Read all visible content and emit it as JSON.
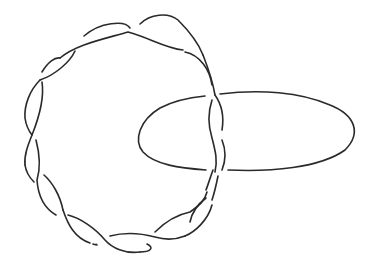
{
  "diagram": {
    "type": "knot-diagram",
    "background": "#ffffff",
    "stroke_color": "#2a2a2a",
    "stroke_width": 1.6,
    "components": [
      {
        "name": "twisted-band",
        "shape": "circular two-strand twist",
        "center": [
          120,
          135
        ],
        "radius": 100,
        "crossings": 22
      },
      {
        "name": "linking-ellipse",
        "shape": "ellipse",
        "center": [
          250,
          140
        ],
        "rx": 105,
        "ry": 38
      }
    ]
  }
}
